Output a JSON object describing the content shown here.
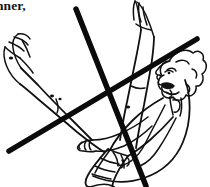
{
  "page": {
    "width": 210,
    "height": 187,
    "background_color": "#ffffff",
    "ink_color": "#111111"
  },
  "caption": {
    "fragment_text": "nner,",
    "note": "partial word cut off at the left edge of the image",
    "color": "#16120f"
  },
  "illustration": {
    "name": "reclining-leg-raise-figure",
    "stroke_color": "#111111",
    "fill_color": "#ffffff",
    "parts": [
      {
        "name": "head-profile",
        "label": "head"
      },
      {
        "name": "curly-hair",
        "label": "hair"
      },
      {
        "name": "face-features",
        "label": "face"
      },
      {
        "name": "neck-and-shoulder",
        "label": "shoulder"
      },
      {
        "name": "torso-outline",
        "label": "torso"
      },
      {
        "name": "arm-near",
        "label": "arm"
      },
      {
        "name": "arm-far",
        "label": "arm"
      },
      {
        "name": "shorts",
        "label": "shorts"
      },
      {
        "name": "leg-upper",
        "label": "leg"
      },
      {
        "name": "leg-lower",
        "label": "leg"
      },
      {
        "name": "foot-upper",
        "label": "foot"
      },
      {
        "name": "foot-lower",
        "label": "foot"
      },
      {
        "name": "ground-arc",
        "label": "ground arc"
      }
    ]
  },
  "cross_out": {
    "name": "x-cross-annotation",
    "meaning": "crossed out / do not do",
    "stroke_color": "#0b0b0b",
    "stroke_width": 5.5,
    "strokes": [
      {
        "name": "stroke-down-right",
        "x1": 76,
        "y1": 9,
        "x2": 146,
        "y2": 186
      },
      {
        "name": "stroke-up-right",
        "x1": 9,
        "y1": 151,
        "x2": 197,
        "y2": 39
      }
    ]
  }
}
